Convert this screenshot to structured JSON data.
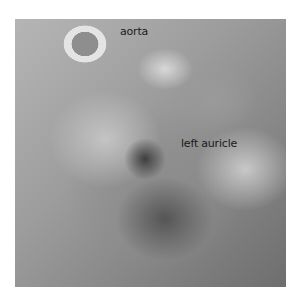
{
  "image": {
    "subject": "dissected heart specimen photograph (grayscale)",
    "labels": [
      {
        "text": "aorta"
      },
      {
        "text": "left auricle"
      }
    ]
  }
}
